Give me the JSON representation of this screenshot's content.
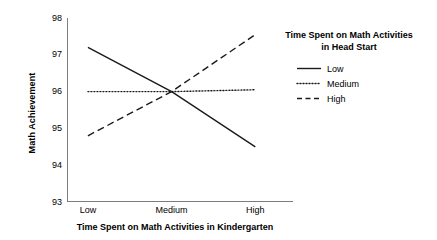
{
  "chart_data": {
    "type": "line",
    "title": "",
    "xlabel": "Time Spent on Math Activities in Kindergarten",
    "ylabel": "Math Achievement",
    "categories": [
      "Low",
      "Medium",
      "High"
    ],
    "x": [
      0,
      1,
      2
    ],
    "xlim": [
      -0.25,
      2.45
    ],
    "ylim": [
      93,
      98
    ],
    "yticks": [
      98,
      97,
      96,
      95,
      94,
      93
    ],
    "ytick_labels": [
      "98",
      "97",
      "96",
      "95",
      "94",
      "93"
    ],
    "grid": false,
    "legend_position": "right",
    "legend_title": "Time Spent on Math Activities in Head Start",
    "legend_title_line1": "Time Spent on Math Activities",
    "legend_title_line2": "in Head Start",
    "series": [
      {
        "name": "Low",
        "style": "solid",
        "color": "#1a1a1a",
        "values": [
          97.2,
          96.0,
          94.5
        ]
      },
      {
        "name": "Medium",
        "style": "dotted",
        "color": "#1a1a1a",
        "values": [
          96.0,
          96.0,
          96.05
        ]
      },
      {
        "name": "High",
        "style": "dashed",
        "color": "#1a1a1a",
        "values": [
          94.8,
          96.0,
          97.55
        ]
      }
    ]
  },
  "axes": {
    "y_title": "Math Achievement",
    "x_title": "Time Spent on Math Activities in Kindergarten",
    "y_tick_labels": [
      "98",
      "97",
      "96",
      "95",
      "94",
      "93"
    ],
    "x_tick_labels": [
      "Low",
      "Medium",
      "High"
    ],
    "axis_color": "#7d7d7d"
  },
  "legend": {
    "title_line1": "Time Spent on Math Activities",
    "title_line2": "in Head Start",
    "entries": [
      {
        "label": "Low",
        "style": "solid"
      },
      {
        "label": "Medium",
        "style": "dotted"
      },
      {
        "label": "High",
        "style": "dashed"
      }
    ]
  }
}
